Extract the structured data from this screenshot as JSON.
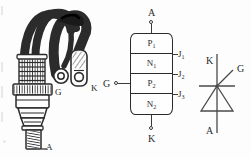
{
  "figure": {
    "background_color": "#fdfdfd",
    "ink_color": "#2b2b2b",
    "panels": [
      "photograph",
      "layer-structure",
      "circuit-symbol"
    ]
  },
  "photo": {
    "caption_terminals": [
      {
        "id": "gate",
        "label": "G"
      },
      {
        "id": "cathode",
        "label": "K"
      },
      {
        "id": "anode",
        "label": "A"
      }
    ],
    "gate_label": "G",
    "cathode_label": "K",
    "anode_label": "A",
    "description_icon": "stud-mount-thyristor-icon"
  },
  "block": {
    "top_terminal": "A",
    "bottom_terminal": "K",
    "gate_terminal": "G",
    "layers": [
      {
        "symbol": "P",
        "index": "1"
      },
      {
        "symbol": "N",
        "index": "1"
      },
      {
        "symbol": "P",
        "index": "2"
      },
      {
        "symbol": "N",
        "index": "2"
      }
    ],
    "junctions": [
      {
        "symbol": "J",
        "index": "1"
      },
      {
        "symbol": "J",
        "index": "2"
      },
      {
        "symbol": "J",
        "index": "3"
      }
    ]
  },
  "symbol": {
    "cathode_label": "K",
    "anode_label": "A",
    "gate_label": "G",
    "icon": "thyristor-symbol-icon"
  }
}
